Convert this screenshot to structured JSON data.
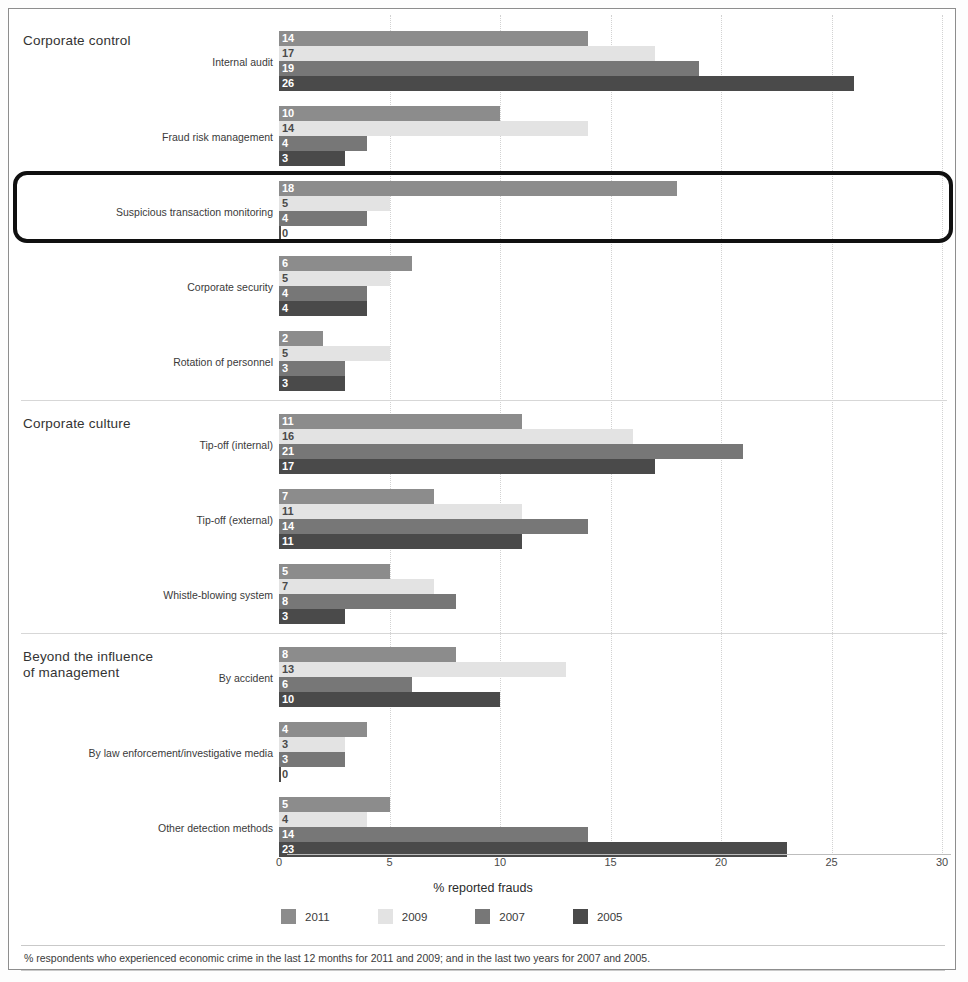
{
  "chart_data": {
    "type": "bar",
    "orientation": "horizontal",
    "title": "",
    "xlabel": "% reported frauds",
    "ylabel": "",
    "xlim": [
      0,
      30
    ],
    "xticks": [
      0,
      5,
      10,
      15,
      20,
      25,
      30
    ],
    "grid": true,
    "legend_position": "bottom",
    "series": [
      {
        "name": "2011",
        "color": "#8c8c8c"
      },
      {
        "name": "2009",
        "color": "#e3e3e3"
      },
      {
        "name": "2007",
        "color": "#777777"
      },
      {
        "name": "2005",
        "color": "#4a4a4a"
      }
    ],
    "sections": [
      {
        "title": "Corporate control",
        "categories": [
          {
            "label": "Internal audit",
            "values": [
              14,
              17,
              19,
              26
            ]
          },
          {
            "label": "Fraud risk management",
            "values": [
              10,
              14,
              4,
              3
            ]
          },
          {
            "label": "Suspicious transaction monitoring",
            "values": [
              18,
              5,
              4,
              0
            ],
            "highlighted": true
          },
          {
            "label": "Corporate security",
            "values": [
              6,
              5,
              4,
              4
            ]
          },
          {
            "label": "Rotation of personnel",
            "values": [
              2,
              5,
              3,
              3
            ]
          }
        ]
      },
      {
        "title": "Corporate culture",
        "categories": [
          {
            "label": "Tip-off (internal)",
            "values": [
              11,
              16,
              21,
              17
            ]
          },
          {
            "label": "Tip-off (external)",
            "values": [
              7,
              11,
              14,
              11
            ]
          },
          {
            "label": "Whistle-blowing system",
            "values": [
              5,
              7,
              8,
              3
            ]
          }
        ]
      },
      {
        "title": "Beyond the influence\nof management",
        "categories": [
          {
            "label": "By accident",
            "values": [
              8,
              13,
              6,
              10
            ]
          },
          {
            "label": "By law enforcement/investigative media",
            "values": [
              4,
              3,
              3,
              0
            ]
          },
          {
            "label": "Other detection methods",
            "values": [
              5,
              4,
              14,
              23
            ]
          }
        ]
      }
    ]
  },
  "footnote": {
    "text": "% respondents who experienced economic crime in the last 12 months for 2011 and 2009; and in the last two years for 2007 and 2005."
  }
}
